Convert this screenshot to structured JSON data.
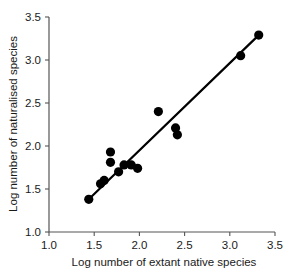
{
  "chart_data": {
    "type": "scatter",
    "title": "",
    "xlabel": "Log number of extant native species",
    "ylabel": "Log number of naturalised species",
    "xlim": [
      1.0,
      3.5
    ],
    "ylim": [
      1.0,
      3.5
    ],
    "xticks": [
      "1.0",
      "1.5",
      "2.0",
      "2.5",
      "3.0",
      "3.5"
    ],
    "yticks": [
      "1.0",
      "1.5",
      "2.0",
      "2.5",
      "3.0",
      "3.5"
    ],
    "xtick_values": [
      1.0,
      1.5,
      2.0,
      2.5,
      3.0,
      3.5
    ],
    "ytick_values": [
      1.0,
      1.5,
      2.0,
      2.5,
      3.0,
      3.5
    ],
    "grid": false,
    "legend": "none",
    "marker": "filled-circle",
    "marker_color": "#000000",
    "points": [
      {
        "x": 1.44,
        "y": 1.38
      },
      {
        "x": 1.57,
        "y": 1.56
      },
      {
        "x": 1.61,
        "y": 1.6
      },
      {
        "x": 1.68,
        "y": 1.93
      },
      {
        "x": 1.68,
        "y": 1.81
      },
      {
        "x": 1.77,
        "y": 1.7
      },
      {
        "x": 1.83,
        "y": 1.78
      },
      {
        "x": 1.91,
        "y": 1.78
      },
      {
        "x": 1.98,
        "y": 1.74
      },
      {
        "x": 2.21,
        "y": 2.4
      },
      {
        "x": 2.4,
        "y": 2.21
      },
      {
        "x": 2.42,
        "y": 2.13
      },
      {
        "x": 3.12,
        "y": 3.05
      },
      {
        "x": 3.32,
        "y": 3.29
      }
    ],
    "fit_line": {
      "type": "linear-regression",
      "x_start": 1.44,
      "y_start": 1.38,
      "x_end": 3.34,
      "y_end": 3.31,
      "color": "#000000"
    }
  }
}
